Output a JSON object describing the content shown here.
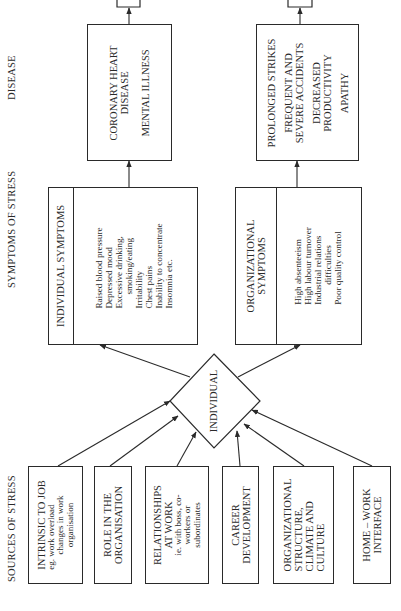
{
  "column_headers": {
    "sources": "SOURCES OF STRESS",
    "symptoms": "SYMPTOMS OF STRESS",
    "disease": "DISEASE"
  },
  "sources": [
    {
      "title": [
        "INTRINSIC TO JOB"
      ],
      "detail": [
        "eg. work overload",
        "changes in work",
        "organisation"
      ]
    },
    {
      "title": [
        "ROLE IN THE",
        "ORGANISATION"
      ],
      "detail": []
    },
    {
      "title": [
        "RELATIONSHIPS",
        "AT WORK"
      ],
      "detail": [
        "ie. with boss, co-",
        "workers or",
        "subordinates"
      ]
    },
    {
      "title": [
        "CAREER",
        "DEVELOPMENT"
      ],
      "detail": []
    },
    {
      "title": [
        "ORGANIZATIONAL",
        "STRUCTURE,",
        "CLIMATE AND",
        "CULTURE"
      ],
      "detail": []
    },
    {
      "title": [
        "HOME – WORK",
        "INTERFACE"
      ],
      "detail": []
    }
  ],
  "center_node": "INDIVIDUAL",
  "symptoms": {
    "individual": {
      "title": "INDIVIDUAL SYMPTOMS",
      "items": [
        "Raised blood pressure",
        "Depressed mood",
        "Excessive drinking,",
        "    smoking/eating",
        "Irritability",
        "Chest pains",
        "Inability to concentrate",
        "Insomnia etc."
      ]
    },
    "organizational": {
      "title": [
        "ORGANIZATIONAL",
        "SYMPTOMS"
      ],
      "items": [
        "High absenteeism",
        "High labour turnover",
        "Industrial relations",
        "    difficulties",
        "Poor quality control"
      ]
    }
  },
  "disease": {
    "individual": [
      "CORONARY HEART",
      "DISEASE",
      "",
      "MENTAL ILLNESS"
    ],
    "organizational": [
      "PROLONGED STRIKES",
      "",
      "FREQUENT AND",
      "SEVERE ACCIDENTS",
      "",
      "DECREASED",
      "PRODUCTIVITY",
      "",
      "APATHY"
    ]
  }
}
